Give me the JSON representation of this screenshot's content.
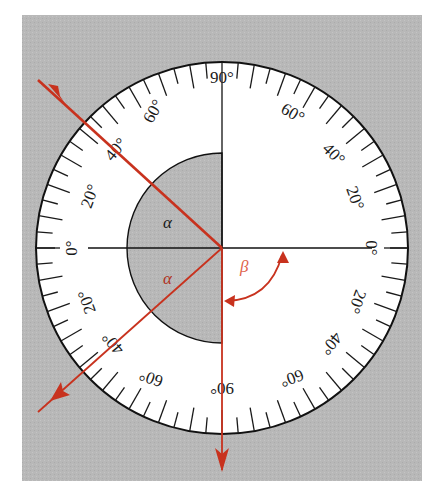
{
  "figure": {
    "title": "",
    "background_color": "#b9b9b9",
    "dial_color": "#ffffff",
    "ray_color": "#c8321e",
    "ink_color": "#1a1a1a",
    "center": [
      222,
      248
    ],
    "outer_radius": 186,
    "inner_semicircle_radius": 95,
    "tick_step_deg": 5,
    "major_tick_step_deg": 10
  },
  "scale_labels": {
    "top": "90°",
    "upper_left_60": "60°",
    "upper_left_40": "40°",
    "upper_left_20": "20°",
    "left_0": "0°",
    "lower_left_20": "20°",
    "lower_left_40": "40°",
    "lower_left_60": "60°",
    "bottom": "90°",
    "lower_right_60": "60°",
    "lower_right_40": "40°",
    "lower_right_20": "20°",
    "right_0": "0°",
    "upper_right_20": "20°",
    "upper_right_40": "40°",
    "upper_right_60": "60°"
  },
  "angle_labels": {
    "incident": "α",
    "reflected": "α",
    "refracted": "β"
  },
  "rays": [
    {
      "name": "incident-ray",
      "from": [
        38,
        80
      ],
      "to": [
        222,
        248
      ]
    },
    {
      "name": "reflected-ray",
      "from": [
        222,
        248
      ],
      "to": [
        38,
        412
      ]
    },
    {
      "name": "refracted-ray",
      "from": [
        222,
        248
      ],
      "to": [
        222,
        470
      ]
    }
  ]
}
